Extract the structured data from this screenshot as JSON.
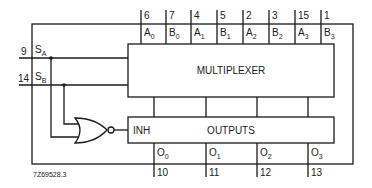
{
  "blocks": {
    "mux": "MULTIPLEXER",
    "outputs": "OUTPUTS",
    "inh": "INH"
  },
  "selects": [
    {
      "pin": "9",
      "label": "S",
      "sub": "A"
    },
    {
      "pin": "14",
      "label": "S",
      "sub": "B"
    }
  ],
  "inputs": [
    {
      "pin": "6",
      "label": "A",
      "sub": "0"
    },
    {
      "pin": "7",
      "label": "B",
      "sub": "0"
    },
    {
      "pin": "4",
      "label": "A",
      "sub": "1"
    },
    {
      "pin": "5",
      "label": "B",
      "sub": "1"
    },
    {
      "pin": "2",
      "label": "A",
      "sub": "2"
    },
    {
      "pin": "3",
      "label": "B",
      "sub": "2"
    },
    {
      "pin": "15",
      "label": "A",
      "sub": "3"
    },
    {
      "pin": "1",
      "label": "B",
      "sub": "3"
    }
  ],
  "outputs": [
    {
      "pin": "10",
      "label": "O",
      "sub": "0"
    },
    {
      "pin": "11",
      "label": "O",
      "sub": "1"
    },
    {
      "pin": "12",
      "label": "O",
      "sub": "2"
    },
    {
      "pin": "13",
      "label": "O",
      "sub": "3"
    }
  ],
  "figure_id": "7Z69528.3"
}
